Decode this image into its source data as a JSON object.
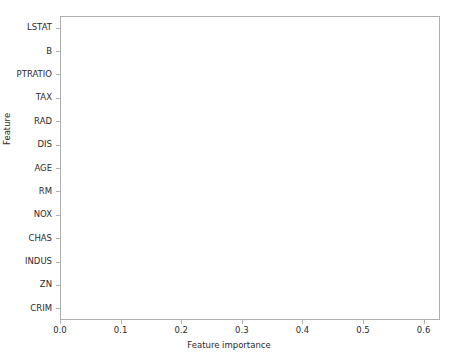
{
  "chart_data": {
    "type": "bar",
    "orientation": "horizontal",
    "title": "",
    "xlabel": "Feature importance",
    "ylabel": "Feature",
    "xlim": [
      0.0,
      0.627
    ],
    "grid": false,
    "legend": null,
    "bar_color": "#595959",
    "xticks": [
      "0.0",
      "0.1",
      "0.2",
      "0.3",
      "0.4",
      "0.5",
      "0.6"
    ],
    "xtick_values": [
      0.0,
      0.1,
      0.2,
      0.3,
      0.4,
      0.5,
      0.6
    ],
    "categories": [
      "LSTAT",
      "B",
      "PTRATIO",
      "TAX",
      "RAD",
      "DIS",
      "AGE",
      "RM",
      "NOX",
      "CHAS",
      "INDUS",
      "ZN",
      "CRIM"
    ],
    "values": [
      0.6,
      0.0,
      0.01,
      0.005,
      0.0,
      0.09,
      0.008,
      0.252,
      0.016,
      0.0,
      0.0,
      0.0,
      0.025
    ]
  }
}
